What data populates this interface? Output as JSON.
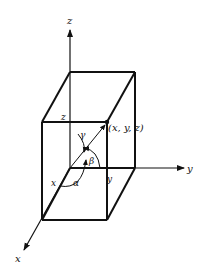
{
  "figure": {
    "axes": {
      "x_label": "x",
      "y_label": "y",
      "z_label": "z"
    },
    "point_label": "(x, y, z)",
    "edge_labels": {
      "x": "x",
      "y": "y",
      "z": "z"
    },
    "angle_labels": {
      "alpha": "α",
      "beta": "β",
      "gamma": "γ"
    },
    "colors": {
      "line": "#111111",
      "background": "#ffffff"
    }
  }
}
